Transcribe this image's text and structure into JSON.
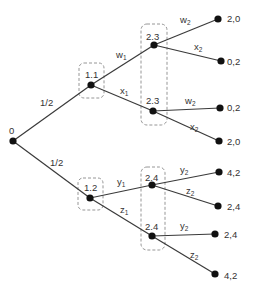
{
  "diagram": {
    "type": "extensive-form game tree",
    "root": {
      "label": "0"
    },
    "chance_probabilities": [
      "1/2",
      "1/2"
    ],
    "player1_nodes": [
      {
        "label": "1.1",
        "actions": [
          {
            "name": "w",
            "sub": "1"
          },
          {
            "name": "x",
            "sub": "1"
          }
        ]
      },
      {
        "label": "1.2",
        "actions": [
          {
            "name": "y",
            "sub": "1"
          },
          {
            "name": "z",
            "sub": "1"
          }
        ]
      }
    ],
    "player2_nodes": [
      {
        "label": "2.3",
        "actions": [
          {
            "name": "w",
            "sub": "2"
          },
          {
            "name": "x",
            "sub": "2"
          }
        ],
        "payoffs": [
          "2,0",
          "0,2"
        ]
      },
      {
        "label": "2.3",
        "actions": [
          {
            "name": "w",
            "sub": "2"
          },
          {
            "name": "x",
            "sub": "2"
          }
        ],
        "payoffs": [
          "0,2",
          "2,0"
        ]
      },
      {
        "label": "2.4",
        "actions": [
          {
            "name": "y",
            "sub": "2"
          },
          {
            "name": "z",
            "sub": "2"
          }
        ],
        "payoffs": [
          "4,2",
          "2,4"
        ]
      },
      {
        "label": "2.4",
        "actions": [
          {
            "name": "y",
            "sub": "2"
          },
          {
            "name": "z",
            "sub": "2"
          }
        ],
        "payoffs": [
          "2,4",
          "4,2"
        ]
      }
    ],
    "information_sets": [
      "1.1",
      "1.2",
      "2.3",
      "2.4"
    ],
    "colors": {
      "edge": "#3a3a3a",
      "node": "#111111",
      "text": "#333333",
      "info_set_border": "#8a8a8a"
    }
  }
}
